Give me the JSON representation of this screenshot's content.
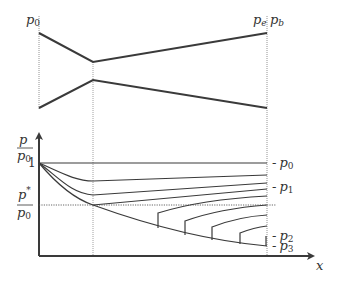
{
  "diagram": {
    "nozzle": {
      "inlet_label": "p",
      "inlet_label_sub": "0",
      "exit_label": "p",
      "exit_label_sub": "e",
      "back_label": "p",
      "back_label_sub": "b"
    },
    "plot": {
      "y_axis_label_num": "p",
      "y_axis_label_den": "p",
      "y_axis_label_den_sub": "0",
      "y_tick_one": "1",
      "critical_label_num": "p",
      "critical_label_num_sup": "*",
      "critical_label_den": "p",
      "critical_label_den_sub": "0",
      "x_axis_label": "x",
      "right_labels": [
        {
          "dash": "-",
          "p": "p",
          "sub": "0"
        },
        {
          "dash": "-",
          "p": "p",
          "sub": "1"
        },
        {
          "dash": "-",
          "p": "p",
          "sub": "2"
        },
        {
          "dash": "-",
          "p": "p",
          "sub": "3"
        }
      ]
    },
    "colors": {
      "line": "#3a3a3a",
      "dotted": "#666666"
    }
  }
}
